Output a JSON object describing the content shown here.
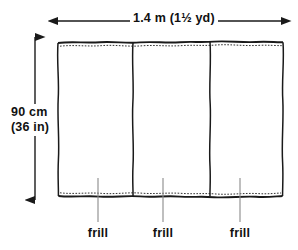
{
  "figure": {
    "background_color": "#ffffff",
    "ink_color": "#1a1a1a",
    "leader_color": "#777777"
  },
  "dimensions": {
    "width": {
      "label": "1.4 m (1½ yd)",
      "arrow_y": 21,
      "arrow_x1": 58,
      "arrow_x2": 281,
      "double_headed": true
    },
    "height": {
      "label_line1": "90 cm",
      "label_line2": "(36 in)",
      "arrow_x": 35,
      "arrow_y1": 37,
      "arrow_y2": 200,
      "double_headed": true
    }
  },
  "fabric": {
    "left": 58,
    "right": 283,
    "top": 42,
    "bottom": 196,
    "seams_x": [
      133,
      210
    ],
    "panel_count": 3,
    "top_hem": "gathered",
    "bottom_hem": "gathered"
  },
  "callouts": [
    {
      "label": "frill",
      "leader_x": 98,
      "leader_top": 178,
      "leader_bottom": 222
    },
    {
      "label": "frill",
      "leader_x": 163,
      "leader_top": 178,
      "leader_bottom": 222
    },
    {
      "label": "frill",
      "leader_x": 240,
      "leader_top": 178,
      "leader_bottom": 222
    }
  ]
}
